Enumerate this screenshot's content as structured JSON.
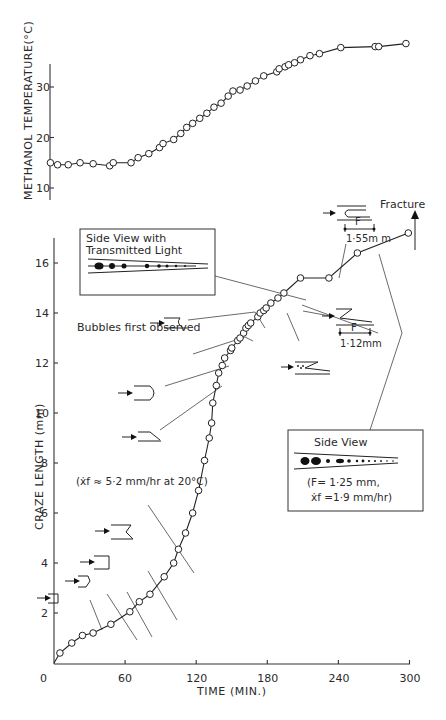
{
  "chart_data": [
    {
      "type": "line",
      "title": "",
      "xlabel": "",
      "ylabel": "METHANOL TEMPERATURE(°C)",
      "yticks": [
        10,
        20,
        30
      ],
      "ylim": [
        8,
        35
      ],
      "xlim": [
        0,
        300
      ],
      "grid": false,
      "series": [
        {
          "name": "Methanol temperature",
          "marker": "open-circle",
          "x": [
            -3,
            3,
            12,
            22,
            33,
            47,
            50,
            65,
            71,
            80,
            89,
            92,
            101,
            107,
            112,
            117,
            123,
            129,
            135,
            141,
            147,
            151,
            157,
            163,
            170,
            177,
            188,
            190,
            195,
            198,
            203,
            208,
            216,
            224,
            242,
            271,
            274,
            297
          ],
          "values": [
            15.0,
            14.6,
            14.6,
            15.0,
            14.8,
            14.4,
            15.0,
            15.0,
            16.0,
            16.8,
            18.0,
            18.8,
            19.6,
            20.8,
            22.0,
            22.8,
            23.8,
            24.8,
            26.0,
            26.8,
            28.2,
            29.2,
            29.4,
            30.2,
            31.2,
            32.2,
            33.0,
            33.6,
            34.0,
            34.4,
            34.8,
            35.4,
            36.2,
            36.6,
            37.8,
            38.0,
            38.0,
            38.6
          ]
        }
      ]
    },
    {
      "type": "line",
      "title": "",
      "xlabel": "TIME (MIN.)",
      "ylabel": "CRAZE LENGTH (mm)",
      "xticks": [
        0,
        60,
        120,
        180,
        240,
        300
      ],
      "yticks": [
        2,
        4,
        6,
        8,
        10,
        12,
        14,
        16
      ],
      "xlim": [
        0,
        300
      ],
      "ylim": [
        0,
        17
      ],
      "grid": false,
      "series": [
        {
          "name": "Craze length",
          "marker": "open-circle",
          "x": [
            0,
            5,
            15,
            24,
            33,
            48,
            64,
            72,
            81,
            93,
            101,
            105,
            111,
            117,
            122,
            127,
            131,
            133,
            134,
            137,
            139,
            142,
            144,
            149,
            150,
            155,
            157,
            160,
            162,
            164,
            166,
            172,
            174,
            177,
            179,
            183,
            189,
            194,
            208,
            232,
            256,
            299
          ],
          "values": [
            0,
            0.4,
            0.8,
            1.1,
            1.2,
            1.55,
            2.05,
            2.45,
            2.75,
            3.45,
            4.0,
            4.55,
            5.2,
            6.0,
            6.9,
            8.1,
            9.0,
            9.6,
            10.4,
            11.1,
            11.6,
            11.9,
            12.2,
            12.5,
            12.6,
            12.9,
            13.0,
            13.2,
            13.4,
            13.5,
            13.6,
            13.85,
            14.0,
            14.1,
            14.2,
            14.4,
            14.6,
            14.8,
            15.4,
            15.4,
            16.4,
            17.2
          ]
        }
      ],
      "annotations": [
        {
          "text": "(ẋf ≈ 5·2 mm/hr at 20°C)",
          "near_x": 101,
          "near_y": 4.0
        },
        {
          "text": "Bubbles  first observed",
          "near_x": 157,
          "near_y": 13.0
        },
        {
          "text": "Fracture",
          "near_x": 299,
          "near_y": 17.2
        },
        {
          "text": "F 1·55 m m",
          "near_x": 232,
          "near_y": 15.4
        },
        {
          "text": "F 1·12 m m",
          "near_x": 183,
          "near_y": 14.4
        }
      ]
    }
  ],
  "labels": {
    "top_ylabel": "METHANOL  TEMPERATURE(°C)",
    "bottom_ylabel": "CRAZE    LENGTH   (mm)",
    "xlabel": "TIME  (MIN.)",
    "rate_note": "(ẋf ≈ 5·2 mm/hr at 20°C)",
    "bubbles": "Bubbles  first observed",
    "fracture": "Fracture",
    "F": "F",
    "f155": "1·55m m",
    "f112": "1·12mm",
    "box1_line1": "Side View with",
    "box1_line2": "Transmitted Light",
    "box2_title": "Side View",
    "box2_line1": "(F= 1·25 mm,",
    "box2_line2": "ẋf =1·9 mm/hr)"
  }
}
